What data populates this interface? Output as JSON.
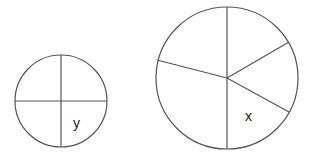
{
  "diagram": {
    "small_circle": {
      "sectors": 4,
      "label": "y"
    },
    "large_circle": {
      "sectors": 5,
      "label": "x"
    },
    "stroke_color": "#555555",
    "label_color": "#222222"
  }
}
